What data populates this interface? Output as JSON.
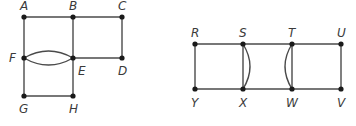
{
  "graphs": [
    {
      "name": "left-graph",
      "vertices": [
        {
          "id": "A",
          "x": 24,
          "y": 17,
          "label": "A",
          "lx": 20,
          "ly": 10
        },
        {
          "id": "B",
          "x": 73,
          "y": 17,
          "label": "B",
          "lx": 69,
          "ly": 10
        },
        {
          "id": "C",
          "x": 122,
          "y": 17,
          "label": "C",
          "lx": 118,
          "ly": 10
        },
        {
          "id": "F",
          "x": 24,
          "y": 58,
          "label": "F",
          "lx": 9,
          "ly": 62
        },
        {
          "id": "E",
          "x": 73,
          "y": 58,
          "label": "E",
          "lx": 78,
          "ly": 75
        },
        {
          "id": "D",
          "x": 122,
          "y": 58,
          "label": "D",
          "lx": 118,
          "ly": 75
        },
        {
          "id": "G",
          "x": 24,
          "y": 96,
          "label": "G",
          "lx": 19,
          "ly": 113
        },
        {
          "id": "H",
          "x": 73,
          "y": 96,
          "label": "H",
          "lx": 69,
          "ly": 113
        }
      ],
      "edges": [
        {
          "from": "A",
          "to": "B"
        },
        {
          "from": "B",
          "to": "C"
        },
        {
          "from": "A",
          "to": "F"
        },
        {
          "from": "F",
          "to": "G"
        },
        {
          "from": "B",
          "to": "E"
        },
        {
          "from": "C",
          "to": "D"
        },
        {
          "from": "E",
          "to": "D"
        },
        {
          "from": "G",
          "to": "H"
        },
        {
          "from": "E",
          "to": "H"
        },
        {
          "from": "F",
          "to": "E",
          "curve": "up"
        },
        {
          "from": "F",
          "to": "E",
          "curve": "down"
        }
      ]
    },
    {
      "name": "right-graph",
      "vertices": [
        {
          "id": "R",
          "x": 195,
          "y": 44,
          "label": "R",
          "lx": 191,
          "ly": 37
        },
        {
          "id": "S",
          "x": 243,
          "y": 44,
          "label": "S",
          "lx": 239,
          "ly": 37
        },
        {
          "id": "T",
          "x": 292,
          "y": 44,
          "label": "T",
          "lx": 288,
          "ly": 37
        },
        {
          "id": "U",
          "x": 341,
          "y": 44,
          "label": "U",
          "lx": 337,
          "ly": 37
        },
        {
          "id": "Y",
          "x": 195,
          "y": 89,
          "label": "Y",
          "lx": 191,
          "ly": 107
        },
        {
          "id": "X",
          "x": 243,
          "y": 89,
          "label": "X",
          "lx": 239,
          "ly": 107
        },
        {
          "id": "W",
          "x": 292,
          "y": 89,
          "label": "W",
          "lx": 286,
          "ly": 107
        },
        {
          "id": "V",
          "x": 341,
          "y": 89,
          "label": "V",
          "lx": 337,
          "ly": 107
        }
      ],
      "edges": [
        {
          "from": "R",
          "to": "S"
        },
        {
          "from": "S",
          "to": "T"
        },
        {
          "from": "T",
          "to": "U"
        },
        {
          "from": "Y",
          "to": "X"
        },
        {
          "from": "X",
          "to": "W"
        },
        {
          "from": "W",
          "to": "V"
        },
        {
          "from": "R",
          "to": "Y"
        },
        {
          "from": "U",
          "to": "V"
        },
        {
          "from": "S",
          "to": "X"
        },
        {
          "from": "S",
          "to": "X",
          "curve": "right"
        },
        {
          "from": "T",
          "to": "W"
        },
        {
          "from": "T",
          "to": "W",
          "curve": "left"
        }
      ]
    }
  ]
}
